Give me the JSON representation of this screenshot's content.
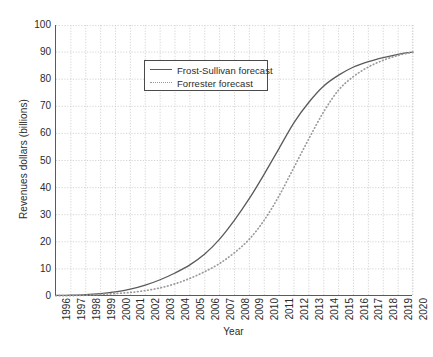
{
  "chart_data": {
    "type": "line",
    "title": "",
    "xlabel": "Year",
    "ylabel": "Revenues dollars (billions)",
    "xlim": [
      1996,
      2020
    ],
    "ylim": [
      0,
      100
    ],
    "grid": true,
    "legend_position": "upper left inside axes",
    "categories": [
      1996,
      1997,
      1998,
      1999,
      2000,
      2001,
      2002,
      2003,
      2004,
      2005,
      2006,
      2007,
      2008,
      2009,
      2010,
      2011,
      2012,
      2013,
      2014,
      2015,
      2016,
      2017,
      2018,
      2019,
      2020
    ],
    "xtick_labels": [
      "1996",
      "1997",
      "1998",
      "1999",
      "2000",
      "2001",
      "2002",
      "2003",
      "2004",
      "2005",
      "2006",
      "2007",
      "2008",
      "2009",
      "2010",
      "2011",
      "2012",
      "2013",
      "2014",
      "2015",
      "2016",
      "2017",
      "2018",
      "2019",
      "2020"
    ],
    "ytick_labels": [
      "0",
      "10",
      "20",
      "30",
      "40",
      "50",
      "60",
      "70",
      "80",
      "90",
      "100"
    ],
    "ytick_values": [
      0,
      10,
      20,
      30,
      40,
      50,
      60,
      70,
      80,
      90,
      100
    ],
    "series": [
      {
        "name": "Frost-Sullivan forecast",
        "style": "solid",
        "color": "#5a5a5a",
        "values": [
          0.2,
          0.3,
          0.5,
          0.9,
          1.5,
          2.5,
          4.0,
          6.0,
          8.5,
          11.5,
          15.5,
          21.0,
          28.0,
          36.0,
          45.0,
          54.5,
          64.0,
          71.5,
          77.5,
          81.5,
          84.5,
          86.5,
          88.0,
          89.2,
          90.0
        ]
      },
      {
        "name": "Forrester forecast",
        "style": "dotted",
        "color": "#9a9a9a",
        "values": [
          0.1,
          0.15,
          0.3,
          0.6,
          0.9,
          1.3,
          2.0,
          3.0,
          4.5,
          6.5,
          9.0,
          12.0,
          16.0,
          21.0,
          28.0,
          37.0,
          47.5,
          58.0,
          68.0,
          76.0,
          81.0,
          84.5,
          87.0,
          88.8,
          90.0
        ]
      }
    ]
  },
  "legend": {
    "entries": [
      {
        "label": "Frost-Sullivan forecast"
      },
      {
        "label": "Forrester forecast"
      }
    ]
  }
}
